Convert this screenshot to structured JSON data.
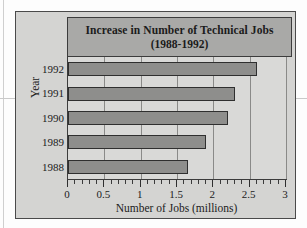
{
  "chart_data": {
    "type": "bar",
    "orientation": "horizontal",
    "title": "Increase in Number of Technical Jobs",
    "subtitle": "(1988-1992)",
    "title_line1": "Increase in Number of Technical Jobs",
    "title_line2": "(1988-1992)",
    "xlabel": "Number of Jobs (millions)",
    "ylabel": "Year",
    "categories": [
      "1992",
      "1991",
      "1990",
      "1989",
      "1988"
    ],
    "values": [
      2.6,
      2.3,
      2.2,
      1.9,
      1.65
    ],
    "xlim": [
      0,
      3
    ],
    "xticks": [
      0,
      0.5,
      1,
      1.5,
      2,
      2.5,
      3
    ],
    "xtick_labels": [
      "0",
      "0.5",
      "1",
      "1.5",
      "2",
      "2.5",
      "3"
    ],
    "minor_tick_step": 0.1,
    "grid": "vertical",
    "legend": "none",
    "colors": {
      "bar_fill": "#8e8e8c",
      "bar_edge": "#2f2f2f",
      "plot_background": "#d9d9d7",
      "panel_background": "#d4d4d2",
      "title_band_background": "#a9a9a7",
      "gridline": "#8a8a88",
      "text": "#1b1b1b"
    }
  }
}
